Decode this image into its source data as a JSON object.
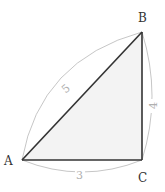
{
  "diagram": {
    "type": "right-triangle",
    "vertices": [
      {
        "id": "A",
        "label": "A",
        "x": 22,
        "y": 160
      },
      {
        "id": "B",
        "label": "B",
        "x": 142,
        "y": 32
      },
      {
        "id": "C",
        "label": "C",
        "x": 142,
        "y": 160
      }
    ],
    "sides": [
      {
        "id": "AB",
        "from": "A",
        "to": "B",
        "length_label": "5"
      },
      {
        "id": "BC",
        "from": "B",
        "to": "C",
        "length_label": "4"
      },
      {
        "id": "AC",
        "from": "A",
        "to": "C",
        "length_label": "3"
      }
    ],
    "right_angle_at": "C",
    "colors": {
      "fill": "#f3f3f3",
      "edge": "#333333",
      "arc": "#b8b8b8",
      "label": "#333333",
      "measure_label": "#b0b0b0"
    }
  }
}
